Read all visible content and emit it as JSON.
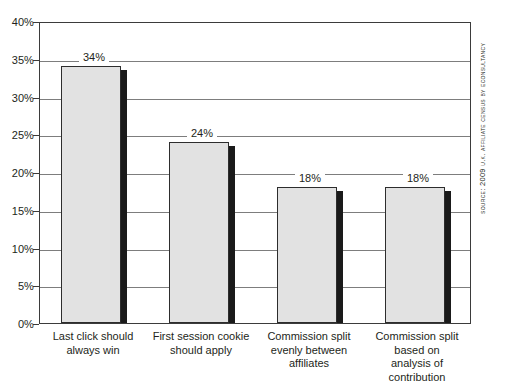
{
  "chart_data": {
    "type": "bar",
    "title": "",
    "subtitle": "",
    "xlabel": "",
    "ylabel": "",
    "ylim": [
      0,
      40
    ],
    "grid": true,
    "legend": "none",
    "orientation": "vertical",
    "categories": [
      "Last click should always win",
      "First session cookie should apply",
      "Commission split evenly between affiliates",
      "Commission split based on analysis of contribution"
    ],
    "category_lines": [
      [
        "Last click should",
        "always win"
      ],
      [
        "First session cookie",
        "should apply"
      ],
      [
        "Commission split",
        "evenly between",
        "affiliates"
      ],
      [
        "Commission split",
        "based on",
        "analysis of",
        "contribution"
      ]
    ],
    "values": [
      34,
      24,
      18,
      18
    ],
    "value_labels": [
      "34%",
      "24%",
      "18%",
      "18%"
    ],
    "y_ticks": [
      0,
      5,
      10,
      15,
      20,
      25,
      30,
      35,
      40
    ],
    "y_tick_labels": [
      "0%",
      "5%",
      "10%",
      "15%",
      "20%",
      "25%",
      "30%",
      "35%",
      "40%"
    ],
    "colors": {
      "bar_fill": "#e2e2e2",
      "bar_border": "#2d2d2d",
      "bar_shadow": "#1a1a1a",
      "gridline": "#7d7d7d",
      "axis": "#3b3b3b",
      "text": "#231f20",
      "background": "#ffffff"
    }
  },
  "source": {
    "label": "Source:",
    "text": "Source: 2009 U.K. Affiliate Census by Econsultancy"
  }
}
